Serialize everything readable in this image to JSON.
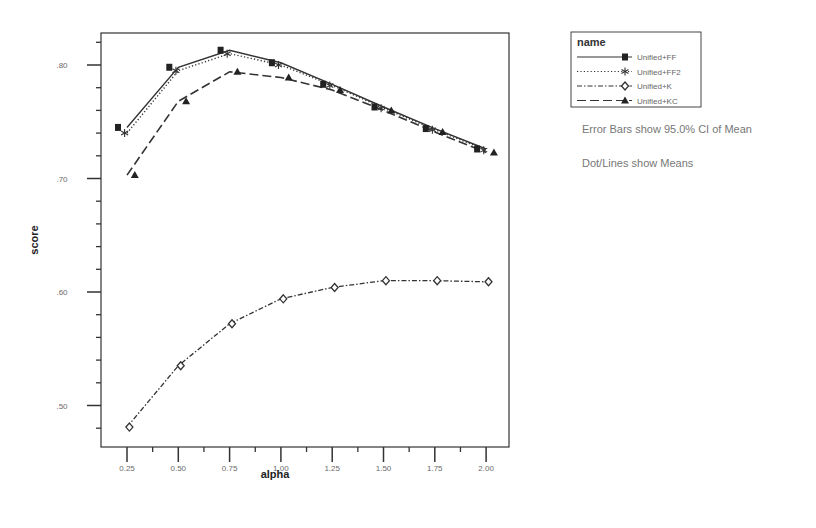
{
  "chart_data": {
    "type": "line",
    "title": "",
    "xlabel": "alpha",
    "ylabel": "score",
    "x": [
      0.25,
      0.5,
      0.75,
      1.0,
      1.25,
      1.5,
      1.75,
      2.0
    ],
    "x_tick_labels": [
      "0.25",
      "0.50",
      "0.75",
      "1.00",
      "1.25",
      "1.50",
      "1.75",
      "2.00"
    ],
    "y_tick_labels": [
      ".80",
      ".70",
      ".60",
      ".50"
    ],
    "xlim": [
      0.15,
      2.15
    ],
    "ylim": [
      0.465,
      0.828
    ],
    "grid": false,
    "legend_position": "right-top",
    "legend_title": "name",
    "series": [
      {
        "name": "Unified+FF",
        "marker": "square",
        "line_style": "solid",
        "values": [
          0.745,
          0.798,
          0.813,
          0.802,
          0.783,
          0.763,
          0.744,
          0.726
        ]
      },
      {
        "name": "Unified+FF2",
        "marker": "asterisk",
        "line_style": "dotted",
        "values": [
          0.74,
          0.795,
          0.81,
          0.8,
          0.782,
          0.762,
          0.743,
          0.725
        ]
      },
      {
        "name": "Unified+K",
        "marker": "diamond",
        "line_style": "dash-dot",
        "values": [
          0.481,
          0.535,
          0.572,
          0.594,
          0.604,
          0.61,
          0.61,
          0.609
        ]
      },
      {
        "name": "Unified+KC",
        "marker": "triangle",
        "line_style": "dashed",
        "values": [
          0.703,
          0.768,
          0.794,
          0.789,
          0.778,
          0.76,
          0.741,
          0.723
        ]
      }
    ],
    "annotations": [
      "Error Bars show 95.0% CI of Mean",
      "Dot/Lines show Means"
    ]
  },
  "legend": {
    "title": "name",
    "items": [
      "Unified+FF",
      "Unified+FF2",
      "Unified+K",
      "Unified+KC"
    ]
  },
  "notes": {
    "error_bars": "Error Bars show 95.0% CI of Mean",
    "dot_lines": "Dot/Lines show Means"
  }
}
